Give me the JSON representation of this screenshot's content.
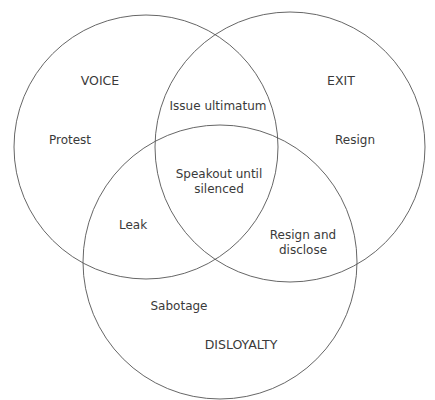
{
  "diagram": {
    "type": "venn",
    "stroke_color": "#555555",
    "text_color": "#3a3a3a",
    "sets": [
      {
        "id": "voice",
        "label": "VOICE",
        "cx": 146,
        "cy": 147,
        "r": 132
      },
      {
        "id": "exit",
        "label": "EXIT",
        "cx": 290,
        "cy": 147,
        "r": 135
      },
      {
        "id": "disloyalty",
        "label": "DISLOYALTY",
        "cx": 220,
        "cy": 262,
        "r": 137
      }
    ],
    "regions": {
      "voice_only": "Protest",
      "exit_only": "Resign",
      "disloyalty_only": "Sabotage",
      "voice_exit": "Issue ultimatum",
      "voice_disloyalty": "Leak",
      "exit_disloyalty_line1": "Resign and",
      "exit_disloyalty_line2": "disclose",
      "all_line1": "Speakout until",
      "all_line2": "silenced"
    }
  }
}
